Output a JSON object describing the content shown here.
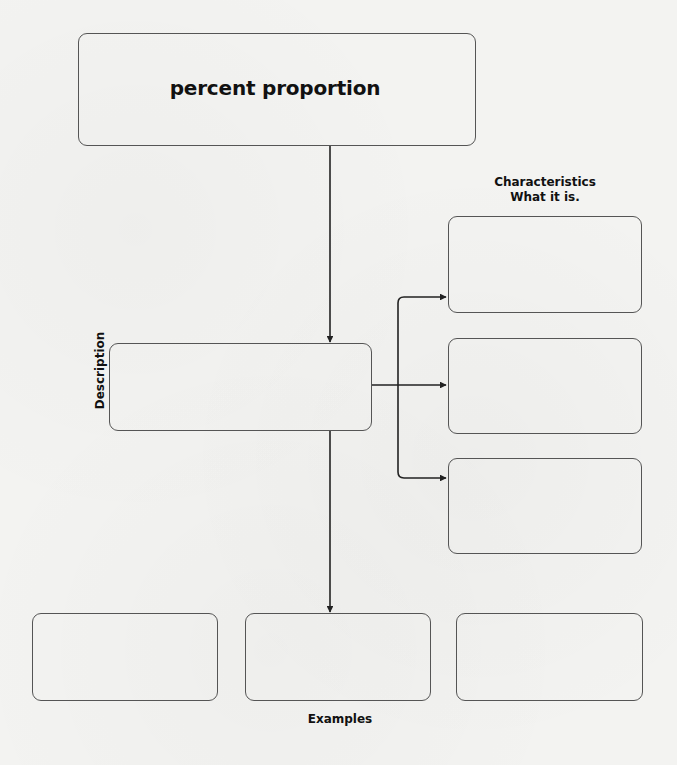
{
  "diagram": {
    "title": "percent proportion",
    "characteristics": {
      "label_line1": "Characteristics",
      "label_line2": "What it is.",
      "boxes": [
        "",
        "",
        ""
      ]
    },
    "description": {
      "label": "Description",
      "content": ""
    },
    "examples": {
      "label": "Examples",
      "boxes": [
        "",
        "",
        ""
      ]
    },
    "colors": {
      "stroke": "#555555",
      "arrow": "#222222",
      "background": "#f3f3f1"
    }
  }
}
